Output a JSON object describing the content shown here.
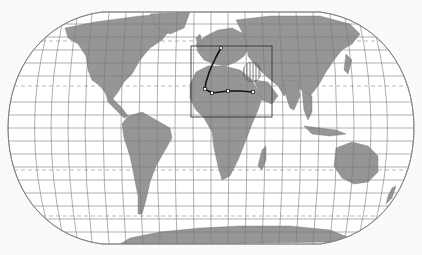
{
  "map": {
    "projection": "Robinson-like pseudocylindrical",
    "colors": {
      "background": "#fafafa",
      "ocean": "#ffffff",
      "land": "#969696",
      "graticule": "#7a7a7a",
      "tropics": "#8a8a8a",
      "route": "#111111",
      "focus_box": "#333333",
      "hatch": "#555555"
    },
    "focus_box": {
      "x": 191,
      "y": 46,
      "width": 81,
      "height": 71
    },
    "route": {
      "points": [
        [
          221,
          48
        ],
        [
          216,
          57
        ],
        [
          210,
          70
        ],
        [
          206,
          82
        ],
        [
          205,
          89
        ],
        [
          212,
          93
        ],
        [
          228,
          91
        ],
        [
          240,
          91
        ],
        [
          253,
          92
        ]
      ],
      "waypoints": [
        [
          221,
          48
        ],
        [
          205,
          89
        ],
        [
          212,
          93
        ],
        [
          228,
          91
        ],
        [
          253,
          92
        ]
      ]
    },
    "hatched_region": {
      "cx": 252,
      "cy": 72,
      "rx": 9,
      "ry": 10
    }
  }
}
